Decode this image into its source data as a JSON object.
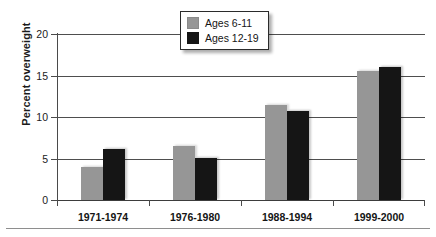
{
  "chart_data": {
    "type": "bar",
    "title": "",
    "subtitle": "",
    "xlabel": "",
    "ylabel": "Percent overweight",
    "categories": [
      "1971-1974",
      "1976-1980",
      "1988-1994",
      "1999-2000"
    ],
    "series": [
      {
        "name": "Ages 6-11",
        "color": "#969696",
        "values": [
          4.0,
          6.5,
          11.5,
          15.6
        ]
      },
      {
        "name": "Ages 12-19",
        "color": "#151515",
        "values": [
          6.1,
          5.1,
          10.7,
          16.0
        ]
      }
    ],
    "ylim": [
      0,
      20
    ],
    "yticks": [
      0,
      5,
      10,
      15,
      20
    ],
    "ytick_labels": [
      "0",
      "5",
      "10",
      "15",
      "20"
    ],
    "grid": true,
    "grid_axis": "y",
    "legend_position": "top-center",
    "annotations": []
  },
  "legend": {
    "entries": [
      {
        "label": "Ages 6-11"
      },
      {
        "label": "Ages 12-19"
      }
    ]
  }
}
